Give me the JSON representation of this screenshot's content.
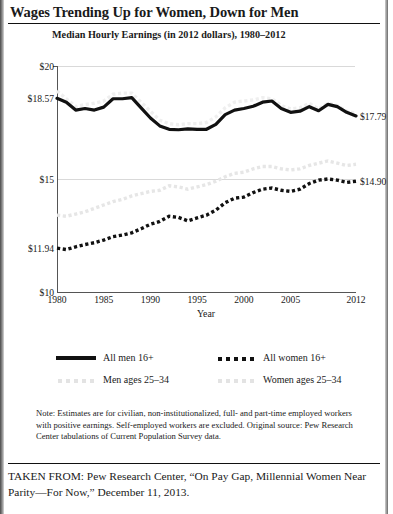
{
  "headline": "Wages Trending Up for Women, Down for Men",
  "subtitle": "Median Hourly Earnings (in 2012 dollars), 1980–2012",
  "legend": {
    "men_all": "All men 16+",
    "men_2534": "Men ages 25–34",
    "women_all": "All women 16+",
    "women_2534": "Women ages 25–34"
  },
  "note": "Note: Estimates  are for civilian, non-institutionalized, full- and part-time employed workers with positive earnings. Self-employed workers are excluded. Original source: Pew Research Center tabulations of Current Population Survey data.",
  "taken_from": "TAKEN FROM: Pew Research Center, “On Pay Gap, Millennial Women Near Parity—For Now,” December 11, 2013.",
  "colors": {
    "men_all": "#111111",
    "women_all": "#111111",
    "men_2534": "#efefef",
    "women_2534": "#e6e6e6",
    "grid": "#d9d9d9",
    "axis": "#555555"
  },
  "chart_data": {
    "type": "line",
    "title": "Median Hourly Earnings (in 2012 dollars), 1980–2012",
    "xlabel": "Year",
    "ylabel": "",
    "xlim": [
      1980,
      2012
    ],
    "ylim": [
      10,
      20
    ],
    "grid": true,
    "legend_position": "below",
    "ytick_labels": [
      "$20",
      "$18.57",
      "$15",
      "$11.94",
      "$10"
    ],
    "ytick_values": [
      20,
      18.57,
      15,
      11.94,
      10
    ],
    "xtick_labels": [
      "1980",
      "1985",
      "1990",
      "1995",
      "2000",
      "2005",
      "2012"
    ],
    "xtick_values": [
      1980,
      1985,
      1990,
      1995,
      2000,
      2005,
      2012
    ],
    "x": [
      1980,
      1981,
      1982,
      1983,
      1984,
      1985,
      1986,
      1987,
      1988,
      1989,
      1990,
      1991,
      1992,
      1993,
      1994,
      1995,
      1996,
      1997,
      1998,
      1999,
      2000,
      2001,
      2002,
      2003,
      2004,
      2005,
      2006,
      2007,
      2008,
      2009,
      2010,
      2011,
      2012
    ],
    "series": [
      {
        "name": "All men 16+",
        "style": "solid",
        "color": "#111111",
        "end_label": "$17.79",
        "start_label": "$18.57",
        "values": [
          18.57,
          18.4,
          18.05,
          18.12,
          18.05,
          18.18,
          18.55,
          18.55,
          18.6,
          18.15,
          17.7,
          17.35,
          17.2,
          17.18,
          17.22,
          17.2,
          17.2,
          17.42,
          17.85,
          18.05,
          18.12,
          18.22,
          18.4,
          18.45,
          18.12,
          17.95,
          18.0,
          18.2,
          18.02,
          18.3,
          18.2,
          17.95,
          17.79
        ]
      },
      {
        "name": "All women 16+",
        "style": "dotted",
        "color": "#111111",
        "end_label": "$14.90",
        "start_label": "$11.94",
        "values": [
          11.94,
          11.88,
          12.0,
          12.1,
          12.18,
          12.3,
          12.45,
          12.52,
          12.62,
          12.8,
          13.0,
          13.12,
          13.35,
          13.3,
          13.15,
          13.28,
          13.4,
          13.62,
          13.95,
          14.15,
          14.2,
          14.4,
          14.55,
          14.6,
          14.5,
          14.45,
          14.55,
          14.8,
          14.95,
          15.0,
          14.95,
          14.85,
          14.9
        ]
      },
      {
        "name": "Men ages 25–34",
        "style": "dotted",
        "color": "#efefef",
        "values": [
          18.9,
          18.55,
          18.2,
          18.3,
          18.35,
          18.45,
          18.75,
          18.8,
          18.8,
          18.4,
          18.0,
          17.6,
          17.45,
          17.4,
          17.45,
          17.45,
          17.5,
          17.75,
          18.15,
          18.4,
          18.45,
          18.5,
          18.6,
          18.55,
          18.25,
          18.1,
          18.15,
          18.35,
          18.1,
          18.35,
          18.25,
          18.0,
          17.9
        ]
      },
      {
        "name": "Women ages 25–34",
        "style": "dotted",
        "color": "#e6e6e6",
        "values": [
          13.4,
          13.35,
          13.45,
          13.55,
          13.7,
          13.85,
          14.0,
          14.1,
          14.25,
          14.35,
          14.45,
          14.5,
          14.7,
          14.65,
          14.55,
          14.65,
          14.75,
          14.9,
          15.1,
          15.25,
          15.3,
          15.45,
          15.55,
          15.55,
          15.45,
          15.4,
          15.45,
          15.6,
          15.7,
          15.8,
          15.7,
          15.6,
          15.65
        ]
      }
    ]
  }
}
